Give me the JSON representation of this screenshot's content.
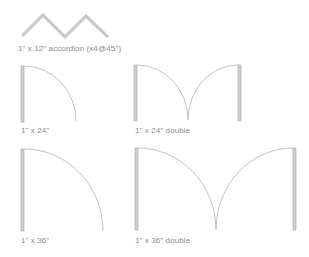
{
  "diagram": {
    "type": "door-symbol-palette",
    "colors": {
      "panel_fill": "#c8c8c8",
      "panel_stroke": "#a0a0a0",
      "arc_stroke": "#a8a8a8",
      "accordion_stroke": "#cfcfcf",
      "label_color": "#8a8a8a",
      "background": "#ffffff"
    },
    "items": [
      {
        "id": "accordion",
        "label": "1\" x 12\" accordion (x4@45°)"
      },
      {
        "id": "single-24",
        "label": "1\" x 24\""
      },
      {
        "id": "double-24",
        "label": "1\" x 24\" double"
      },
      {
        "id": "single-36",
        "label": "1\" x 36\""
      },
      {
        "id": "double-36",
        "label": "1\" x 36\" double"
      }
    ]
  }
}
